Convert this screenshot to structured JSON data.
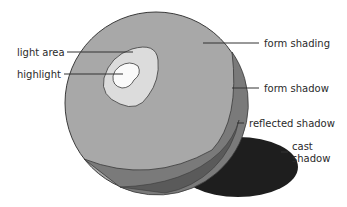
{
  "diagram": {
    "labels": {
      "light_area": "light area",
      "highlight": "highlight",
      "form_shading": "form shading",
      "form_shadow": "form shadow",
      "reflected_shadow": "reflected shadow",
      "cast_shadow_line1": "cast",
      "cast_shadow_line2": "shadow"
    },
    "colors": {
      "form_shading": "#a8a8a8",
      "light_area": "#dcdcdc",
      "highlight": "#fafafa",
      "form_shadow": "#7a7a7a",
      "reflected_shadow": "#8e8e8e",
      "cast_shadow": "#1e1e1e",
      "outline": "#3a3a3a"
    }
  }
}
